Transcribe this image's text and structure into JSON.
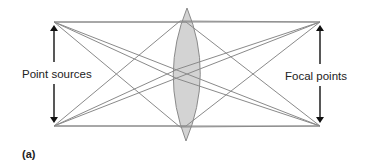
{
  "figure": {
    "panel_label": "(a)",
    "left_label": "Point sources",
    "right_label": "Focal points",
    "colors": {
      "ray": "#8a8a8a",
      "lens_fill": "#d3d3d3",
      "lens_stroke": "#8a8a8a",
      "arrow": "#111111"
    },
    "points": {
      "source_top": [
        54,
        22
      ],
      "source_bottom": [
        54,
        126
      ],
      "focal_top": [
        320,
        22
      ],
      "focal_bottom": [
        320,
        126
      ]
    },
    "lens": {
      "center_x": 187,
      "top_y": 8,
      "bottom_y": 141,
      "half_width": 18
    }
  }
}
